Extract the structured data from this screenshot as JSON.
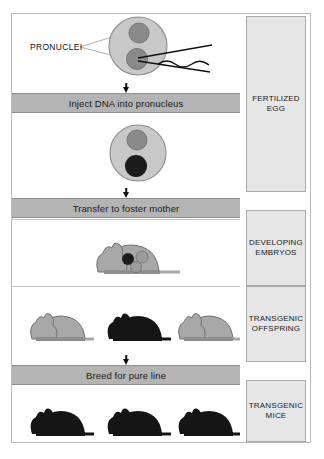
{
  "diagram": {
    "annotations": {
      "pronuclei_label": "PRONUCLEI"
    },
    "process_steps": [
      {
        "id": "inject",
        "label": "Inject DNA into pronucleus"
      },
      {
        "id": "transfer",
        "label": "Transfer to foster mother"
      },
      {
        "id": "breed",
        "label": "Breed for pure line"
      }
    ],
    "stages": [
      {
        "id": "fertilized-egg",
        "line1": "FERTILIZED EGG",
        "line2": ""
      },
      {
        "id": "developing-embryos",
        "line1": "DEVELOPING",
        "line2": "EMBRYOS"
      },
      {
        "id": "transgenic-offspring",
        "line1": "TRANSGENIC",
        "line2": "OFFSPRING"
      },
      {
        "id": "transgenic-mice",
        "line1": "TRANSGENIC",
        "line2": "MICE"
      }
    ],
    "cells": [
      {
        "id": "egg-before-injection",
        "caption": "Fertilized egg with two pronuclei and injection pipette",
        "pronuclei": [
          {
            "id": "male-pronucleus",
            "shade": "gray"
          },
          {
            "id": "female-pronucleus",
            "shade": "gray"
          }
        ]
      },
      {
        "id": "egg-after-injection",
        "caption": "Fertilized egg after DNA injection",
        "pronuclei": [
          {
            "id": "upper-pronucleus",
            "shade": "gray"
          },
          {
            "id": "lower-pronucleus",
            "shade": "black"
          }
        ]
      }
    ],
    "mice": {
      "foster_mother": {
        "id": "pregnant-foster-mouse",
        "coat": "gray",
        "embryos": [
          {
            "id": "embryo-transgenic",
            "shade": "black"
          },
          {
            "id": "embryo-normal-1",
            "shade": "gray"
          },
          {
            "id": "embryo-normal-2",
            "shade": "gray"
          }
        ]
      },
      "offspring": [
        {
          "id": "offspring-1",
          "coat": "gray",
          "transgenic": "no"
        },
        {
          "id": "offspring-2",
          "coat": "black",
          "transgenic": "yes"
        },
        {
          "id": "offspring-3",
          "coat": "gray",
          "transgenic": "no"
        }
      ],
      "pure_line": [
        {
          "id": "pure-mouse-1",
          "coat": "black",
          "transgenic": "yes"
        },
        {
          "id": "pure-mouse-2",
          "coat": "black",
          "transgenic": "yes"
        },
        {
          "id": "pure-mouse-3",
          "coat": "black",
          "transgenic": "yes"
        }
      ]
    },
    "colors": {
      "banner_fill": "#b4b4b4",
      "stage_fill": "#e6e6e6",
      "cell_fill": "#c8c8c8",
      "pronucleus_gray": "#8a8a8a",
      "pronucleus_black": "#1c1c1c",
      "mouse_gray": "#a8a8a8",
      "mouse_black": "#151515",
      "frame_border": "#b9b9b9"
    }
  }
}
